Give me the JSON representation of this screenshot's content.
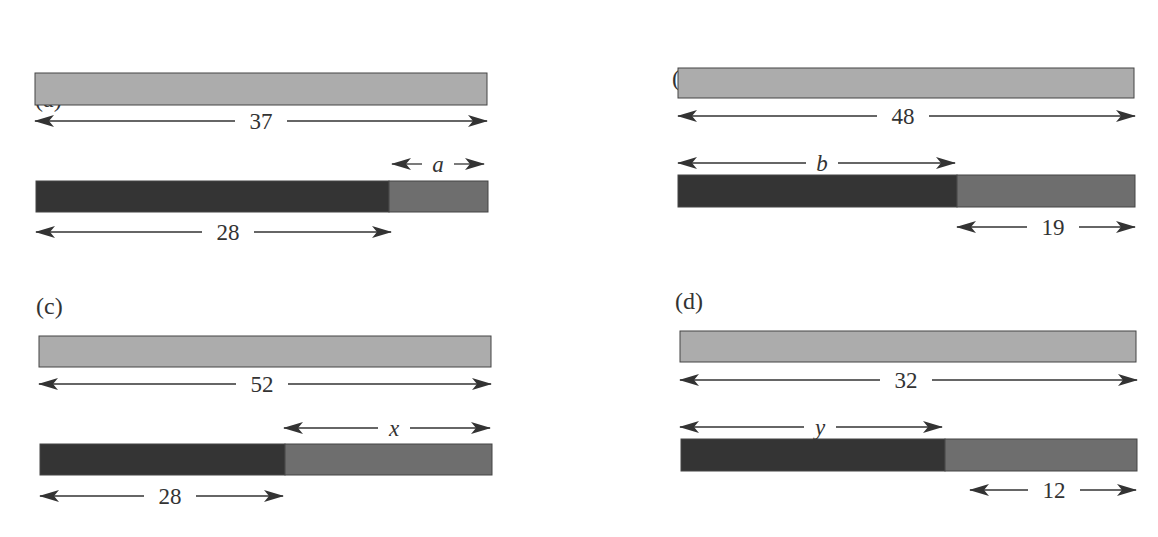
{
  "colors": {
    "whole_bar": "#acacac",
    "known_part": "#343434",
    "unknown_part": "#6e6e6e",
    "bar_border": "#444444",
    "ink": "#333333"
  },
  "panels": [
    {
      "id": "a",
      "label": "(a)",
      "label_pos": [
        35,
        107
      ],
      "whole": {
        "value": "37",
        "bar": [
          35,
          73,
          487,
          105
        ],
        "arrow": {
          "y": 121,
          "x1": 35,
          "x2": 487,
          "text_x": 261
        }
      },
      "parts": {
        "bar": [
          36,
          181,
          488,
          212
        ],
        "split_x": 389,
        "first": {
          "value": "28",
          "italic": false,
          "arrow": {
            "y": 232,
            "x1": 36,
            "x2": 391,
            "text_x": 228
          }
        },
        "second": {
          "value": "a",
          "italic": true,
          "arrow": {
            "y": 164,
            "x1": 392,
            "x2": 484,
            "text_x": 438
          }
        }
      }
    },
    {
      "id": "b",
      "label": "(b)",
      "label_pos": [
        672,
        86
      ],
      "whole": {
        "value": "48",
        "bar": [
          678,
          68,
          1134,
          98
        ],
        "arrow": {
          "y": 116,
          "x1": 678,
          "x2": 1135,
          "text_x": 903
        }
      },
      "parts": {
        "bar": [
          678,
          175,
          1135,
          207
        ],
        "split_x": 957,
        "first": {
          "value": "b",
          "italic": true,
          "arrow": {
            "y": 163,
            "x1": 678,
            "x2": 955,
            "text_x": 822
          }
        },
        "second": {
          "value": "19",
          "italic": false,
          "arrow": {
            "y": 227,
            "x1": 957,
            "x2": 1135,
            "text_x": 1053
          }
        }
      }
    },
    {
      "id": "c",
      "label": "(c)",
      "label_pos": [
        36,
        314
      ],
      "whole": {
        "value": "52",
        "bar": [
          39,
          336,
          491,
          367
        ],
        "arrow": {
          "y": 384,
          "x1": 39,
          "x2": 491,
          "text_x": 262
        }
      },
      "parts": {
        "bar": [
          40,
          444,
          492,
          475
        ],
        "split_x": 285,
        "first": {
          "value": "28",
          "italic": false,
          "arrow": {
            "y": 496,
            "x1": 40,
            "x2": 283,
            "text_x": 170
          }
        },
        "second": {
          "value": "x",
          "italic": true,
          "arrow": {
            "y": 428,
            "x1": 284,
            "x2": 490,
            "text_x": 394
          }
        }
      }
    },
    {
      "id": "d",
      "label": "(d)",
      "label_pos": [
        675,
        309
      ],
      "whole": {
        "value": "32",
        "bar": [
          680,
          331,
          1136,
          362
        ],
        "arrow": {
          "y": 380,
          "x1": 680,
          "x2": 1137,
          "text_x": 906
        }
      },
      "parts": {
        "bar": [
          681,
          439,
          1137,
          471
        ],
        "split_x": 945,
        "first": {
          "value": "y",
          "italic": true,
          "arrow": {
            "y": 427,
            "x1": 680,
            "x2": 942,
            "text_x": 820
          }
        },
        "second": {
          "value": "12",
          "italic": false,
          "arrow": {
            "y": 490,
            "x1": 970,
            "x2": 1136,
            "text_x": 1054
          }
        }
      }
    }
  ]
}
